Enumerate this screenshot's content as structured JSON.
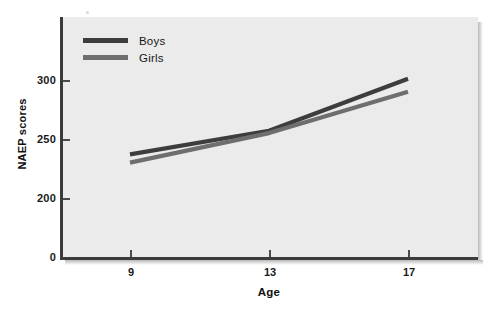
{
  "axes": {
    "y_title": "NAEP scores",
    "x_title": "Age",
    "y_ticks": [
      "300",
      "250",
      "200",
      "0"
    ],
    "x_ticks": [
      "9",
      "13",
      "17"
    ]
  },
  "legend": {
    "entries": [
      {
        "label": "Boys",
        "color": "#3d3d3d"
      },
      {
        "label": "Girls",
        "color": "#6e6e6e"
      }
    ]
  },
  "chart_data": {
    "type": "line",
    "title": "",
    "subtitle": "",
    "xlabel": "Age",
    "ylabel": "NAEP scores",
    "x": [
      9,
      13,
      17
    ],
    "categories": [
      "9",
      "13",
      "17"
    ],
    "series": [
      {
        "name": "Boys",
        "color": "#3d3d3d",
        "values": [
          237,
          257,
          301
        ]
      },
      {
        "name": "Girls",
        "color": "#6e6e6e",
        "values": [
          230,
          255,
          290
        ]
      }
    ],
    "xlim": [
      8,
      18.2
    ],
    "ylim": [
      0,
      320
    ],
    "ytick_values": [
      300,
      250,
      200,
      0
    ],
    "xtick_values": [
      9,
      13,
      17
    ],
    "grid": false,
    "legend_position": "top-left",
    "plot_background": "#ebebeb",
    "annotations": []
  }
}
